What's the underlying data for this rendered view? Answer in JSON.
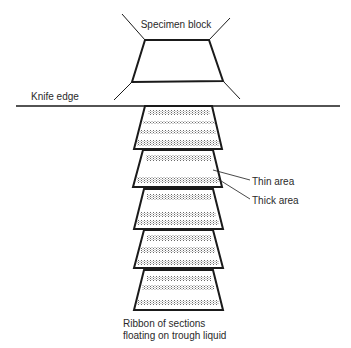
{
  "diagram": {
    "labels": {
      "specimen_block": "Specimen block",
      "knife_edge": "Knife edge",
      "thin_area": "Thin area",
      "thick_area": "Thick area",
      "ribbon_line1": "Ribbon of sections",
      "ribbon_line2": "floating on trough liquid"
    },
    "sections_count": 5,
    "colors": {
      "line": "#1a1a1a",
      "stipple": "#777777",
      "background": "#ffffff"
    }
  }
}
